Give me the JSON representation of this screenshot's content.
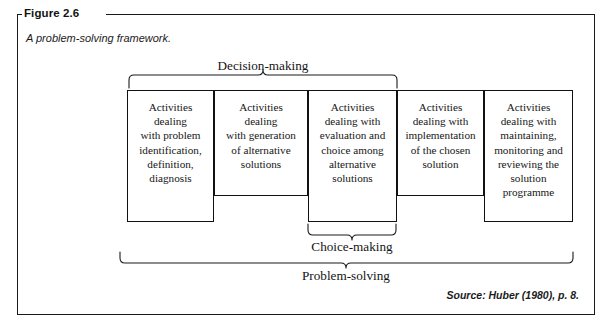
{
  "figure": {
    "label": "Figure 2.6",
    "caption": "A problem-solving framework.",
    "source": "Source: Huber (1980), p. 8."
  },
  "diagram": {
    "type": "process-framework",
    "boxes": [
      {
        "id": "problem-identification",
        "text": "Activities\ndealing\nwith problem\nidentification,\ndefinition,\ndiagnosis",
        "x": 127,
        "y": 90,
        "width": 87,
        "height": 132
      },
      {
        "id": "generation-of-alternatives",
        "text": "Activities\ndealing\nwith generation\nof alternative\nsolutions",
        "x": 214,
        "y": 90,
        "width": 94,
        "height": 106
      },
      {
        "id": "evaluation-and-choice",
        "text": "Activities\ndealing with\nevaluation and\nchoice among\nalternative\nsolutions",
        "x": 308,
        "y": 90,
        "width": 89,
        "height": 132
      },
      {
        "id": "implementation",
        "text": "Activities\ndealing with\nimplementation\nof the chosen\nsolution",
        "x": 397,
        "y": 90,
        "width": 87,
        "height": 106
      },
      {
        "id": "maintaining-monitoring-reviewing",
        "text": "Activities\ndealing with\nmaintaining,\nmonitoring and\nreviewing the\nsolution\nprogramme",
        "x": 484,
        "y": 90,
        "width": 89,
        "height": 132
      }
    ],
    "brackets": [
      {
        "id": "decision-making",
        "label": "Decision-making",
        "orientation": "top",
        "x1": 129,
        "x2": 397,
        "label_x": 263,
        "label_y": 58
      },
      {
        "id": "choice-making",
        "label": "Choice-making",
        "orientation": "bottom",
        "x1": 308,
        "x2": 396,
        "label_x": 352,
        "label_y": 239
      },
      {
        "id": "problem-solving",
        "label": "Problem-solving",
        "orientation": "bottom",
        "x1": 120,
        "x2": 573,
        "label_x": 346,
        "label_y": 268
      }
    ]
  },
  "colors": {
    "frame": "#1a1a1a",
    "box_border": "#111111",
    "text": "#161616",
    "background": "#ffffff"
  }
}
